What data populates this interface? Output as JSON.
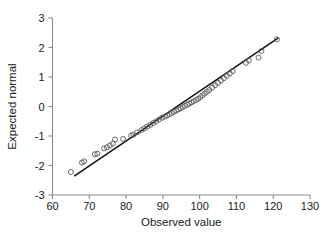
{
  "chart_data": {
    "type": "scatter",
    "title": "",
    "subtitle": "",
    "xlabel": "Observed value",
    "ylabel": "Expected normal",
    "xlim": [
      60,
      130
    ],
    "ylim": [
      -3,
      3
    ],
    "xticks": [
      60,
      70,
      80,
      90,
      100,
      110,
      120,
      130
    ],
    "xtick_labels": [
      "60",
      "70",
      "80",
      "90",
      "100",
      "110",
      "120",
      "130"
    ],
    "yticks": [
      -3,
      -2,
      -1,
      0,
      1,
      2,
      3
    ],
    "ytick_labels": [
      "-3",
      "-2",
      "-1",
      "0",
      "1",
      "2",
      "3"
    ],
    "grid": false,
    "legend": null,
    "legend_position": "none",
    "marker_style": "open-circle",
    "marker_color": "#5a5a5a",
    "line_color": "#111111",
    "axis_color": "#8c8c8c",
    "series": [
      {
        "name": "Q-Q points",
        "type": "scatter",
        "x": [
          65.0,
          68.0,
          68.6,
          71.5,
          72.2,
          74.0,
          74.8,
          75.6,
          76.4,
          77.0,
          79.2,
          81.4,
          82.0,
          83.0,
          84.2,
          85.0,
          85.8,
          86.6,
          87.4,
          88.2,
          89.0,
          89.8,
          90.6,
          91.2,
          91.8,
          92.4,
          93.0,
          93.6,
          94.2,
          94.8,
          95.4,
          96.0,
          96.6,
          97.2,
          97.8,
          98.4,
          99.0,
          99.6,
          100.2,
          100.8,
          101.4,
          102.0,
          102.6,
          103.4,
          104.2,
          105.0,
          105.8,
          106.6,
          107.4,
          108.2,
          109.0,
          112.6,
          113.4,
          116.0,
          116.8,
          121.0
        ],
        "y": [
          -2.22,
          -1.9,
          -1.86,
          -1.62,
          -1.6,
          -1.42,
          -1.38,
          -1.32,
          -1.26,
          -1.12,
          -1.1,
          -0.98,
          -0.96,
          -0.88,
          -0.8,
          -0.74,
          -0.68,
          -0.62,
          -0.56,
          -0.5,
          -0.44,
          -0.38,
          -0.34,
          -0.3,
          -0.26,
          -0.22,
          -0.18,
          -0.14,
          -0.1,
          -0.06,
          -0.02,
          0.02,
          0.06,
          0.1,
          0.14,
          0.18,
          0.22,
          0.26,
          0.32,
          0.38,
          0.44,
          0.5,
          0.56,
          0.64,
          0.72,
          0.8,
          0.88,
          0.96,
          1.04,
          1.12,
          1.2,
          1.48,
          1.56,
          1.66,
          1.88,
          2.28
        ]
      },
      {
        "name": "Reference line",
        "type": "line",
        "x": [
          66.0,
          121.3
        ],
        "y": [
          -2.35,
          2.32
        ]
      }
    ]
  },
  "axes": {
    "x": {
      "label": "Observed value",
      "min": 60,
      "max": 130,
      "ticks": [
        "60",
        "70",
        "80",
        "90",
        "100",
        "110",
        "120",
        "130"
      ]
    },
    "y": {
      "label": "Expected normal",
      "min": -3,
      "max": 3,
      "ticks": [
        "-3",
        "-2",
        "-1",
        "0",
        "1",
        "2",
        "3"
      ]
    }
  }
}
